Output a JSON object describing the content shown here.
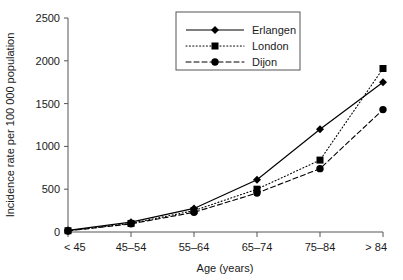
{
  "chart_data": {
    "type": "line",
    "title": "",
    "xlabel": "Age (years)",
    "ylabel": "Incidence rate per 100 000 population",
    "categories": [
      "< 45",
      "45–54",
      "55–64",
      "65–74",
      "75–84",
      "> 84"
    ],
    "ylim": [
      0,
      2500
    ],
    "yticks": [
      0,
      500,
      1000,
      1500,
      2000,
      2500
    ],
    "ytick_labels": [
      "0",
      "500",
      "1000",
      "1500",
      "2000",
      "2500"
    ],
    "grid": false,
    "legend_position": "top-center",
    "series": [
      {
        "name": "Erlangen",
        "marker": "diamond",
        "line_style": "solid",
        "color": "#000000",
        "values": [
          20,
          115,
          275,
          610,
          1200,
          1750
        ]
      },
      {
        "name": "London",
        "marker": "square",
        "line_style": "dotted",
        "color": "#000000",
        "values": [
          15,
          100,
          250,
          500,
          840,
          1910
        ]
      },
      {
        "name": "Dijon",
        "marker": "circle",
        "line_style": "dashed",
        "color": "#000000",
        "values": [
          12,
          95,
          230,
          455,
          740,
          1430
        ]
      }
    ]
  },
  "legend": {
    "entries": [
      {
        "label": "Erlangen"
      },
      {
        "label": "London"
      },
      {
        "label": "Dijon"
      }
    ]
  }
}
